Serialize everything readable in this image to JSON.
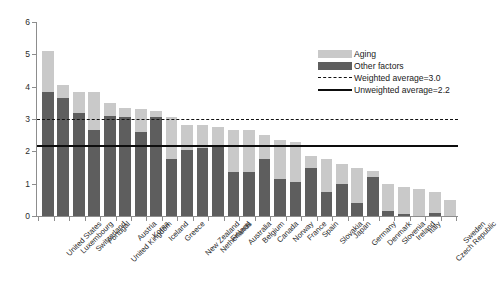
{
  "chart_data": {
    "type": "bar",
    "stacked": true,
    "title": "",
    "xlabel": "",
    "ylabel": "",
    "ylim": [
      0,
      6
    ],
    "yticks": [
      0,
      1,
      2,
      3,
      4,
      5,
      6
    ],
    "grid": false,
    "legend_position": "top-right",
    "categories": [
      "United States",
      "Luxembourg",
      "Switzerland",
      "Portugal",
      "United Kingdom",
      "Austria",
      "Korea",
      "Iceland",
      "Greece",
      "New Zealand",
      "Netherlands",
      "Finland",
      "Australia",
      "Belgium",
      "Canada",
      "Norway",
      "France",
      "Spain",
      "Slovakia",
      "Japan",
      "Germany",
      "Denmark",
      "Slovenia",
      "Ireland",
      "Italy",
      "Czech Republic",
      "Sweden"
    ],
    "series": [
      {
        "name": "Other factors",
        "color": "#5e5e5e",
        "values": [
          3.85,
          3.65,
          3.2,
          2.65,
          3.1,
          3.05,
          2.6,
          3.05,
          1.75,
          2.05,
          2.1,
          2.15,
          1.35,
          1.35,
          1.75,
          1.15,
          1.05,
          1.5,
          0.75,
          1.0,
          0.4,
          1.2,
          0.15,
          0.05,
          0.0,
          0.1,
          0.0
        ]
      },
      {
        "name": "Aging",
        "color": "#c9c9c9",
        "values": [
          1.25,
          0.4,
          0.65,
          1.2,
          0.4,
          0.3,
          0.7,
          0.2,
          1.3,
          0.75,
          0.7,
          0.6,
          1.3,
          1.3,
          0.75,
          1.2,
          1.25,
          0.35,
          1.0,
          0.6,
          1.1,
          0.2,
          0.85,
          0.85,
          0.85,
          0.65,
          0.5
        ]
      }
    ],
    "totals": [
      5.1,
      4.05,
      3.85,
      3.85,
      3.5,
      3.35,
      3.3,
      3.25,
      3.05,
      2.8,
      2.8,
      2.75,
      2.65,
      2.65,
      2.5,
      2.35,
      2.3,
      1.85,
      1.75,
      1.6,
      1.5,
      1.4,
      1.0,
      0.9,
      0.85,
      0.75,
      0.5
    ],
    "reference_lines": [
      {
        "label": "Weighted average=3.0",
        "value": 3.0,
        "style": "dashed",
        "color": "#111111"
      },
      {
        "label": "Unweighted average=2.2",
        "value": 2.2,
        "style": "solid",
        "color": "#0d0d0d"
      }
    ]
  },
  "legend": {
    "items": [
      {
        "label": "Aging",
        "kind": "swatch-aging"
      },
      {
        "label": "Other factors",
        "kind": "swatch-other"
      },
      {
        "label": "Weighted average=3.0",
        "kind": "line-dashed"
      },
      {
        "label": "Unweighted average=2.2",
        "kind": "line-solid"
      }
    ]
  }
}
